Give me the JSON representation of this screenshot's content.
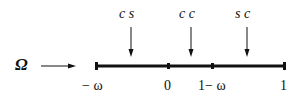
{
  "diagram": {
    "input_symbol": "Ω",
    "top_labels": [
      {
        "text": "c s",
        "x": 131
      },
      {
        "text": "c c",
        "x": 191
      },
      {
        "text": "s c",
        "x": 246
      }
    ],
    "axis_labels": [
      {
        "text": "− ω",
        "x": 96
      },
      {
        "text": "0",
        "x": 168
      },
      {
        "text": "1− ω",
        "x": 212
      },
      {
        "text": "1",
        "x": 284
      }
    ],
    "colors": {
      "ink": "#111111",
      "background": "#ffffff"
    }
  }
}
